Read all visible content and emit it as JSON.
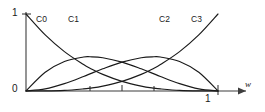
{
  "chart_data": {
    "type": "line",
    "title": "",
    "subtitle": "",
    "xlabel": "w",
    "ylabel": "",
    "xlim": [
      0,
      1
    ],
    "ylim": [
      0,
      1
    ],
    "grid": false,
    "legend": "inline-curve-labels",
    "x_tick_labels": [
      "0",
      "1"
    ],
    "y_tick_labels": [
      "0",
      "1"
    ],
    "x_ticks": [
      0,
      0.3333,
      0.5,
      0.6667,
      1
    ],
    "y_ticks": [
      0,
      1
    ],
    "annotations": [
      {
        "text": "C0",
        "x": 0.06,
        "y": 0.84
      },
      {
        "text": "C1",
        "x": 0.23,
        "y": 0.84
      },
      {
        "text": "C2",
        "x": 0.72,
        "y": 0.84
      },
      {
        "text": "C3",
        "x": 0.89,
        "y": 0.84
      }
    ],
    "series": [
      {
        "name": "C0",
        "formula": "(1-w)^3",
        "x": [
          0,
          0.1,
          0.2,
          0.3,
          0.3333,
          0.4,
          0.5,
          0.6,
          0.6667,
          0.7,
          0.8,
          0.9,
          1
        ],
        "values": [
          1,
          0.729,
          0.512,
          0.343,
          0.2963,
          0.216,
          0.125,
          0.064,
          0.037,
          0.027,
          0.008,
          0.001,
          0
        ]
      },
      {
        "name": "C1",
        "formula": "3w(1-w)^2",
        "x": [
          0,
          0.1,
          0.2,
          0.3,
          0.3333,
          0.4,
          0.5,
          0.6,
          0.6667,
          0.7,
          0.8,
          0.9,
          1
        ],
        "values": [
          0,
          0.243,
          0.384,
          0.441,
          0.4444,
          0.432,
          0.375,
          0.288,
          0.2222,
          0.189,
          0.096,
          0.027,
          0
        ]
      },
      {
        "name": "C2",
        "formula": "3w^2(1-w)",
        "x": [
          0,
          0.1,
          0.2,
          0.3,
          0.3333,
          0.4,
          0.5,
          0.6,
          0.6667,
          0.7,
          0.8,
          0.9,
          1
        ],
        "values": [
          0,
          0.027,
          0.096,
          0.189,
          0.2222,
          0.288,
          0.375,
          0.432,
          0.4444,
          0.441,
          0.384,
          0.243,
          0
        ]
      },
      {
        "name": "C3",
        "formula": "w^3",
        "x": [
          0,
          0.1,
          0.2,
          0.3,
          0.3333,
          0.4,
          0.5,
          0.6,
          0.6667,
          0.7,
          0.8,
          0.9,
          1
        ],
        "values": [
          0,
          0.001,
          0.008,
          0.027,
          0.037,
          0.064,
          0.125,
          0.216,
          0.2963,
          0.343,
          0.512,
          0.729,
          1
        ]
      }
    ],
    "colors": {
      "curve": "#1a1a1a",
      "axis": "#3d3d3d",
      "background": "#ffffff"
    }
  },
  "labels": {
    "c0": "C0",
    "c1": "C1",
    "c2": "C2",
    "c3": "C3",
    "y_one": "1",
    "y_zero": "0",
    "x_one": "1",
    "x_axis_name": "w"
  }
}
